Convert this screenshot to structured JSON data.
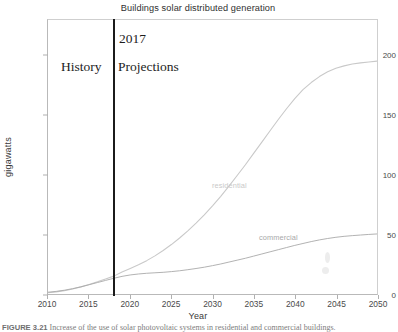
{
  "chart_data": {
    "type": "line",
    "title": "Buildings solar distributed generation",
    "xlabel": "Year",
    "ylabel": "gigawatts",
    "xlim": [
      2010,
      2050
    ],
    "ylim": [
      0,
      230
    ],
    "xticks": [
      "2010",
      "2015",
      "2020",
      "2025",
      "2030",
      "2035",
      "2040",
      "2045",
      "2050"
    ],
    "xtick_values": [
      2010,
      2015,
      2020,
      2025,
      2030,
      2035,
      2040,
      2045,
      2050
    ],
    "yticks": [
      "0",
      "50",
      "100",
      "150",
      "200"
    ],
    "ytick_values": [
      0,
      50,
      100,
      150,
      200
    ],
    "grid": false,
    "legend_position": "inline-labels",
    "x": [
      2010,
      2011,
      2012,
      2013,
      2014,
      2015,
      2016,
      2017,
      2018,
      2019,
      2020,
      2021,
      2022,
      2023,
      2024,
      2025,
      2026,
      2027,
      2028,
      2029,
      2030,
      2031,
      2032,
      2033,
      2034,
      2035,
      2036,
      2037,
      2038,
      2039,
      2040,
      2041,
      2042,
      2043,
      2044,
      2045,
      2046,
      2047,
      2048,
      2049,
      2050
    ],
    "series": [
      {
        "name": "residential",
        "color": "#c9c9c9",
        "values": [
          1.0,
          1.8,
          2.8,
          4.2,
          6.0,
          8.0,
          10.2,
          12.6,
          15.0,
          18.5,
          21.5,
          24.5,
          28.0,
          32.0,
          36.5,
          41.5,
          47.0,
          53.0,
          59.5,
          66.5,
          74.0,
          82.0,
          90.5,
          99.5,
          108.5,
          118.0,
          127.5,
          137.0,
          146.5,
          155.5,
          164.0,
          171.5,
          177.5,
          182.5,
          186.5,
          189.5,
          191.5,
          193.0,
          194.0,
          194.8,
          195.5
        ]
      },
      {
        "name": "commercial",
        "color": "#a8a8a8",
        "values": [
          1.5,
          2.2,
          3.2,
          4.5,
          6.0,
          7.8,
          9.6,
          11.4,
          13.2,
          14.8,
          16.0,
          16.8,
          17.4,
          17.8,
          18.2,
          18.8,
          19.5,
          20.4,
          21.4,
          22.5,
          23.8,
          25.2,
          26.8,
          28.4,
          30.0,
          31.8,
          33.6,
          35.4,
          37.2,
          39.0,
          40.8,
          42.4,
          44.0,
          45.4,
          46.6,
          47.6,
          48.4,
          49.0,
          49.5,
          50.0,
          50.4
        ]
      }
    ],
    "annotations": [
      {
        "name": "divider-year",
        "text": "2017",
        "x": 2018
      },
      {
        "name": "history-region",
        "text": "History"
      },
      {
        "name": "projections-region",
        "text": "Projections"
      }
    ]
  },
  "caption": {
    "number": "FIGURE 3.21",
    "text": "   Increase of the use of solar photovoltaic systems in residential and commercial buildings."
  }
}
